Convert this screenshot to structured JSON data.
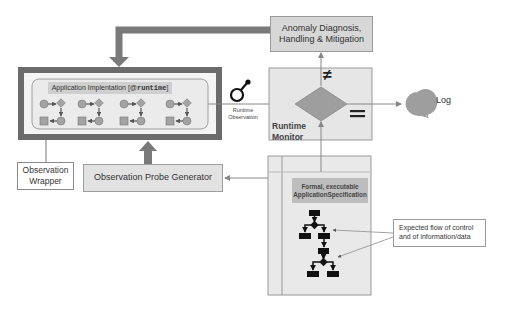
{
  "diagram": {
    "anomaly_box": {
      "line1": "Anomaly Diagnosis,",
      "line2": "Handling & Mitigation"
    },
    "app_impl": {
      "title_prefix": "Application Implentation [@",
      "title_code": "runtime",
      "title_suffix": "]",
      "component_groups": 4
    },
    "observation_wrapper": {
      "line1": "Observation",
      "line2": "Wrapper"
    },
    "probe_generator": {
      "label": "Observation Probe Generator"
    },
    "runtime_observation": {
      "line1": "Runtime",
      "line2": "Observation",
      "icon": "magnifier-icon"
    },
    "runtime_monitor": {
      "line1": "Runtime",
      "line2": "Monitor",
      "not_equal_symbol": "≠",
      "equal_symbol": "="
    },
    "log": {
      "label": "Log",
      "icon": "speech-bubble-icon"
    },
    "specification": {
      "line1": "Formal, executable",
      "line2": "ApplicationSpecification"
    },
    "callout": {
      "line1": "Expected flow of control",
      "line2": "and of information/data"
    },
    "colors": {
      "dark_frame": "#6b6b6b",
      "fat_arrow": "#7a7a7a",
      "box_fill": "#d7d7d7",
      "monitor_fill": "#e6e6e6",
      "diamond_fill": "#9e9e9e",
      "node_fill": "#a3a3a3",
      "flowchart_dark": "#111111"
    }
  }
}
